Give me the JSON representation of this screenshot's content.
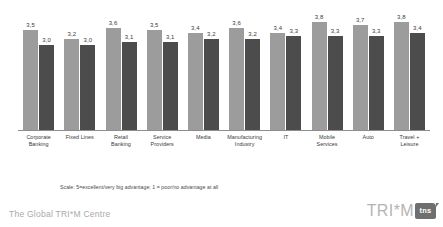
{
  "footer": {
    "title": "The Global TRI*M Centre",
    "logo_word": "TRI*M",
    "logo_badge": "tns"
  },
  "notes": {
    "scale": "Scale: 5=excellent/very big advantage; 1 = poor/no advantage at all"
  },
  "colors": {
    "series1": "#9c9c9c",
    "series2": "#4c4c4c",
    "axis": "#8d8d8d",
    "text": "#3a3a3a",
    "footer_text": "#a9a9a9",
    "logo_badge_bg": "#6f6f6f"
  },
  "chart_data": {
    "type": "bar",
    "title": "",
    "xlabel": "",
    "ylabel": "",
    "ylim": [
      0,
      5
    ],
    "grid": false,
    "legend_position": "none",
    "decimal_separator": ",",
    "categories": [
      "Corporate Banking",
      "Fixed Lines",
      "Retail Banking",
      "Service Providers",
      "Media",
      "Manufacturing Industry",
      "IT",
      "Mobile Services",
      "Auto",
      "Travel + Leisure"
    ],
    "category_lines": [
      [
        "Corporate",
        "Banking"
      ],
      [
        "Fixed Lines"
      ],
      [
        "Retail",
        "Banking"
      ],
      [
        "Service",
        "Providers"
      ],
      [
        "Media"
      ],
      [
        "Manufacturing",
        "Industry"
      ],
      [
        "IT"
      ],
      [
        "Mobile",
        "Services"
      ],
      [
        "Auto"
      ],
      [
        "Travel +",
        "Leisure"
      ]
    ],
    "series": [
      {
        "name": "series-1",
        "color": "#9c9c9c",
        "values": [
          3.5,
          3.2,
          3.6,
          3.5,
          3.4,
          3.6,
          3.4,
          3.8,
          3.7,
          3.8
        ],
        "labels": [
          "3,5",
          "3,2",
          "3,6",
          "3,5",
          "3,4",
          "3,6",
          "3,4",
          "3,8",
          "3,7",
          "3,8"
        ]
      },
      {
        "name": "series-2",
        "color": "#4c4c4c",
        "values": [
          3.0,
          3.0,
          3.1,
          3.1,
          3.2,
          3.2,
          3.3,
          3.3,
          3.3,
          3.4
        ],
        "labels": [
          "3,0",
          "3,0",
          "3,1",
          "3,1",
          "3,2",
          "3,2",
          "3,3",
          "3,3",
          "3,3",
          "3,4"
        ]
      }
    ]
  }
}
